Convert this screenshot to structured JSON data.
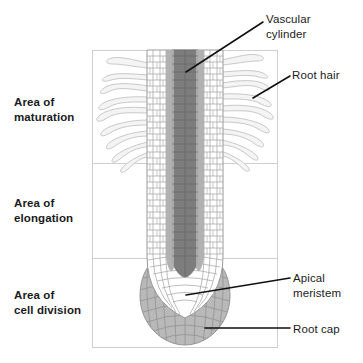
{
  "figure": {
    "background_color": "#ffffff",
    "frame": {
      "border_color": "#cfcfcf",
      "x": 92,
      "y": 50,
      "width": 186,
      "height": 298,
      "divider_y": [
        163,
        258
      ]
    }
  },
  "zone_labels": [
    {
      "id": "maturation",
      "text": "Area of\nmaturation"
    },
    {
      "id": "elongation",
      "text": "Area of\nelongation"
    },
    {
      "id": "cell-division",
      "text": "Area of\ncell division"
    }
  ],
  "callouts": [
    {
      "id": "vascular-cylinder",
      "text": "Vascular\ncylinder"
    },
    {
      "id": "root-hair",
      "text": "Root hair"
    },
    {
      "id": "apical-meristem",
      "text": "Apical\nmeristem"
    },
    {
      "id": "root-cap",
      "text": "Root cap"
    }
  ],
  "colors": {
    "text": "#1b1b1b",
    "leader_line": "#111111",
    "frame_border": "#cfcfcf",
    "cell_wall": "#9a9a9a",
    "cortex_fill": "#ffffff",
    "vascular_core": "#787878",
    "vascular_band": "#ababab",
    "root_cap_fill": "#b4b4b4",
    "root_cap_wall": "#8a8a8a",
    "root_hair_outline": "#c3c3c3",
    "root_hair_fill": "#f2f2f2"
  }
}
